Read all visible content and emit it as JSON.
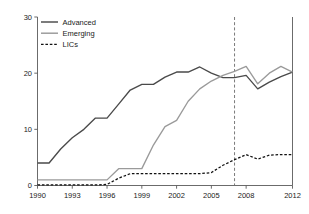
{
  "chart_data": {
    "type": "line",
    "title": "",
    "subtitle": "",
    "xlabel": "",
    "ylabel": "",
    "xlim": [
      1990,
      2012
    ],
    "ylim": [
      0,
      30
    ],
    "grid": false,
    "legend_position": "top-left",
    "x": [
      1990,
      1991,
      1992,
      1993,
      1994,
      1995,
      1996,
      1997,
      1998,
      1999,
      2000,
      2001,
      2002,
      2003,
      2004,
      2005,
      2006,
      2007,
      2008,
      2009,
      2010,
      2011,
      2012
    ],
    "xticks": [
      "1990",
      "1993",
      "1996",
      "1999",
      "2002",
      "2005",
      "2008",
      "2012"
    ],
    "xtick_values": [
      1990,
      1993,
      1996,
      1999,
      2002,
      2005,
      2008,
      2012
    ],
    "yticks": [
      "0",
      "10",
      "20",
      "30"
    ],
    "ytick_values": [
      0,
      10,
      20,
      30
    ],
    "series": [
      {
        "name": "Advanced",
        "color": "#4a4a4a",
        "style": "solid",
        "values": [
          4.0,
          4.0,
          6.5,
          8.5,
          10.0,
          12.0,
          12.0,
          14.5,
          17.0,
          18.0,
          18.0,
          19.3,
          20.2,
          20.2,
          21.1,
          20.0,
          19.2,
          19.2,
          19.6,
          17.2,
          18.4,
          19.4,
          20.2
        ]
      },
      {
        "name": "Emerging",
        "color": "#9a9a9a",
        "style": "solid",
        "values": [
          1.0,
          1.0,
          1.0,
          1.0,
          1.0,
          1.0,
          1.0,
          3.0,
          3.0,
          3.0,
          7.2,
          10.5,
          11.6,
          15.0,
          17.2,
          18.6,
          19.6,
          20.3,
          21.2,
          18.1,
          20.0,
          21.2,
          20.2
        ]
      },
      {
        "name": "LICs",
        "color": "#111111",
        "style": "dashed",
        "values": [
          0.1,
          0.1,
          0.1,
          0.1,
          0.1,
          0.1,
          0.2,
          1.3,
          2.1,
          2.1,
          2.1,
          2.1,
          2.1,
          2.1,
          2.1,
          2.3,
          3.6,
          4.6,
          5.5,
          4.7,
          5.4,
          5.5,
          5.5
        ]
      }
    ],
    "annotations": [
      {
        "type": "vertical-line",
        "name": "reference-year-line",
        "x_value": 2007,
        "style": "dashed",
        "color": "#6b6b6b"
      }
    ]
  },
  "legend": {
    "items": [
      {
        "label": "Advanced"
      },
      {
        "label": "Emerging"
      },
      {
        "label": "LICs"
      }
    ]
  }
}
